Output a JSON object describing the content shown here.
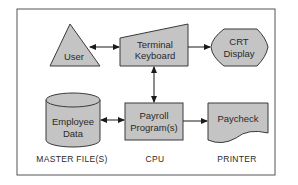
{
  "diagram": {
    "nodes": {
      "user": {
        "label": "User",
        "shape": "triangle"
      },
      "terminal": {
        "line1": "Terminal",
        "line2": "Keyboard",
        "shape": "manual-input-trapezoid"
      },
      "crt": {
        "line1": "CRT",
        "line2": "Display",
        "shape": "display"
      },
      "employee": {
        "line1": "Employee",
        "line2": "Data",
        "shape": "cylinder"
      },
      "payroll": {
        "line1": "Payroll",
        "line2": "Program(s)",
        "shape": "rectangle"
      },
      "paycheck": {
        "label": "Paycheck",
        "shape": "document"
      }
    },
    "captions": {
      "master": "MASTER FILE(S)",
      "cpu": "CPU",
      "printer": "PRINTER"
    },
    "edges": [
      {
        "from": "user",
        "to": "terminal",
        "type": "bidirectional"
      },
      {
        "from": "terminal",
        "to": "crt",
        "type": "directed"
      },
      {
        "from": "terminal",
        "to": "payroll",
        "type": "bidirectional"
      },
      {
        "from": "employee",
        "to": "payroll",
        "type": "bidirectional"
      },
      {
        "from": "payroll",
        "to": "paycheck",
        "type": "directed"
      }
    ],
    "colors": {
      "fill": "#c4c4c4",
      "stroke": "#3a3a3a",
      "background": "#ffffff"
    }
  }
}
